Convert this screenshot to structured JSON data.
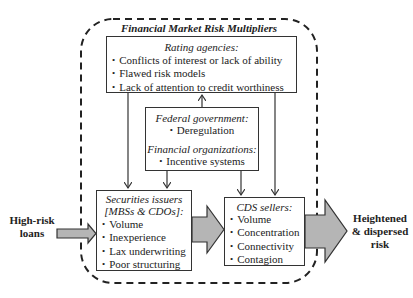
{
  "diagram": {
    "title": "Financial Market Risk Multipliers",
    "input": {
      "label_line1": "High-risk",
      "label_line2": "loans"
    },
    "output": {
      "label_line1": "Heightened",
      "label_line2": "& dispersed",
      "label_line3": "risk"
    },
    "rating_agencies": {
      "heading": "Rating agencies:",
      "items": [
        "Conflicts of interest or lack of ability",
        "Flawed risk models",
        "Lack of attention to credit worthiness"
      ]
    },
    "federal_government": {
      "heading": "Federal government:",
      "items": [
        "Deregulation"
      ]
    },
    "financial_organizations": {
      "heading": "Financial organizations:",
      "items": [
        "Incentive systems"
      ]
    },
    "securities_issuers": {
      "heading_line1": "Securities issuers",
      "heading_line2": "[MBSs & CDOs]:",
      "items": [
        "Volume",
        "Inexperience",
        "Lax underwriting",
        "Poor structuring"
      ]
    },
    "cds_sellers": {
      "heading": "CDS sellers:",
      "items": [
        "Volume",
        "Concentration",
        "Connectivity",
        "Contagion"
      ]
    },
    "colors": {
      "arrow_fill": "#b5b5b5",
      "stroke": "#333333",
      "dashed_border": "#222222"
    }
  }
}
